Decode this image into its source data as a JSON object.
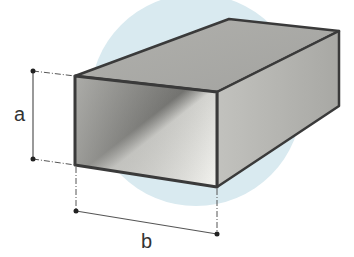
{
  "diagram": {
    "type": "rectangular-hollow-section",
    "labels": {
      "height": "a",
      "width": "b"
    },
    "colors": {
      "background_circle": "#d9eaf0",
      "outline": "#3a3a3a",
      "top_face": "#a9a9a5",
      "side_face": "#b5b5b1",
      "inner_dark": "#8c8c89",
      "inner_light": "#f2f2ee",
      "dimension_line": "#555555"
    }
  }
}
